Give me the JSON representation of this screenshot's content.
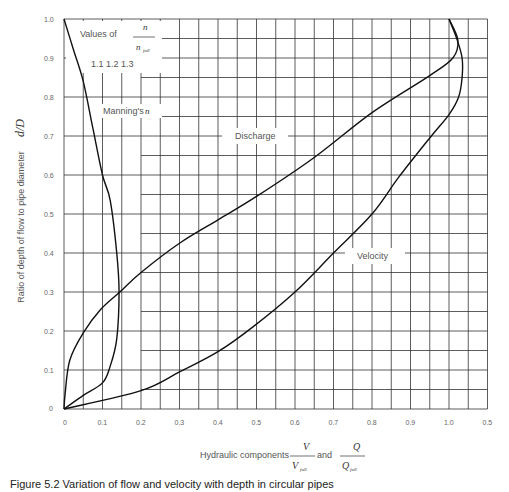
{
  "chart_data": {
    "type": "line",
    "title": "",
    "xlabel": "Hydraulic components V/V_full and Q/Q_full",
    "xlabel_parts": {
      "prefix": "Hydraulic components",
      "v_num": "V",
      "v_den": "V",
      "v_den_sub": "full",
      "joiner": "and",
      "q_num": "Q",
      "q_den": "Q",
      "q_den_sub": "full"
    },
    "ylabel": "Ratio of depth of flow to pipe diameter d/D",
    "ylabel_parts": {
      "text": "Ratio of depth of flow to pipe diameter",
      "sym": "d/D"
    },
    "xlim": [
      0,
      1.1
    ],
    "ylim": [
      0,
      1.0
    ],
    "x_ticks": [
      0,
      0.1,
      0.2,
      0.3,
      0.4,
      0.5,
      0.6,
      0.7,
      0.8,
      0.9,
      1.0,
      1.1
    ],
    "x_tick_labels": [
      "0",
      "0.1",
      "0.2",
      "0.3",
      "0.4",
      "0.5",
      "0.6",
      "0.7",
      "0.8",
      "0.9",
      "1.0",
      "0.5"
    ],
    "y_ticks": [
      0,
      0.1,
      0.2,
      0.3,
      0.4,
      0.5,
      0.6,
      0.7,
      0.8,
      0.9,
      1.0
    ],
    "y_tick_labels": [
      "0",
      "0.1",
      "0.2",
      "0.3",
      "0.4",
      "0.5",
      "0.6",
      "0.7",
      "0.8",
      "0.9",
      "1.0"
    ],
    "grid": true,
    "series": [
      {
        "name": "Discharge",
        "label_at": [
          0.55,
          0.72
        ],
        "points": [
          [
            0,
            0
          ],
          [
            0.003,
            0.04
          ],
          [
            0.015,
            0.125
          ],
          [
            0.05,
            0.195
          ],
          [
            0.095,
            0.255
          ],
          [
            0.145,
            0.3
          ],
          [
            0.2,
            0.35
          ],
          [
            0.3,
            0.425
          ],
          [
            0.4,
            0.485
          ],
          [
            0.5,
            0.545
          ],
          [
            0.65,
            0.645
          ],
          [
            0.8,
            0.76
          ],
          [
            0.95,
            0.855
          ],
          [
            1.01,
            0.9
          ],
          [
            1.023,
            0.946
          ],
          [
            1.0,
            1.0
          ]
        ]
      },
      {
        "name": "Velocity",
        "label_at": [
          0.83,
          0.46
        ],
        "points": [
          [
            0,
            0
          ],
          [
            0.2,
            0.047
          ],
          [
            0.3,
            0.095
          ],
          [
            0.4,
            0.147
          ],
          [
            0.49,
            0.21
          ],
          [
            0.6,
            0.3
          ],
          [
            0.7,
            0.4
          ],
          [
            0.8,
            0.5
          ],
          [
            0.87,
            0.595
          ],
          [
            0.95,
            0.695
          ],
          [
            1.0,
            0.755
          ],
          [
            1.025,
            0.8
          ],
          [
            1.034,
            0.85
          ],
          [
            1.034,
            0.9
          ],
          [
            1.02,
            0.95
          ],
          [
            1.0,
            1.0
          ]
        ]
      },
      {
        "name": "Manning's n",
        "label_at": [
          0.14,
          0.785
        ],
        "points": [
          [
            0,
            0
          ],
          [
            0.05,
            0.035
          ],
          [
            0.1,
            0.067
          ],
          [
            0.12,
            0.11
          ],
          [
            0.137,
            0.18
          ],
          [
            0.143,
            0.3
          ],
          [
            0.137,
            0.4
          ],
          [
            0.12,
            0.535
          ],
          [
            0.1,
            0.6
          ],
          [
            0.075,
            0.72
          ],
          [
            0.05,
            0.84
          ],
          [
            0.025,
            0.92
          ],
          [
            0,
            1.0
          ]
        ]
      }
    ],
    "annotations": {
      "values_of": "Values of",
      "n_num": "n",
      "n_den": "n",
      "n_den_sub": "full",
      "n_values": "1.1 1.2 1.3",
      "mannings_label": "Manning's",
      "mannings_sym": "n"
    }
  },
  "caption": "Figure 5.2 Variation of flow and velocity with depth in circular pipes"
}
